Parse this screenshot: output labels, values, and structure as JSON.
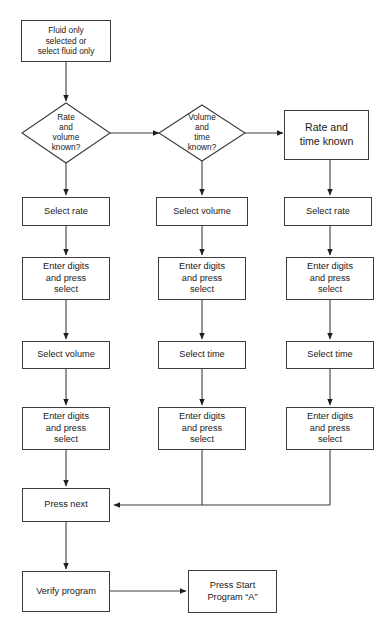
{
  "diagram": {
    "background_color": "#ffffff",
    "line_color": "#3c3c3c",
    "text_color": "#1a1a1a"
  },
  "nodes": {
    "start": {
      "label": "Fluid only\nselected or\nselect fluid only"
    },
    "decision_rate_volume": {
      "label": "Rate\nand\nvolume\nknown?"
    },
    "decision_volume_time": {
      "label": "Volume\nand\ntime\nknown?"
    },
    "rate_time_known": {
      "label": "Rate and\ntime known"
    },
    "col1": {
      "select_rate": {
        "label": "Select rate"
      },
      "enter_digits_1": {
        "label": "Enter digits\nand press\nselect"
      },
      "select_volume": {
        "label": "Select volume"
      },
      "enter_digits_2": {
        "label": "Enter digits\nand press\nselect"
      }
    },
    "col2": {
      "select_volume": {
        "label": "Select volume"
      },
      "enter_digits_1": {
        "label": "Enter digits\nand press\nselect"
      },
      "select_time": {
        "label": "Select time"
      },
      "enter_digits_2": {
        "label": "Enter digits\nand press\nselect"
      }
    },
    "col3": {
      "select_rate": {
        "label": "Select rate"
      },
      "enter_digits_1": {
        "label": "Enter digits\nand press\nselect"
      },
      "select_time": {
        "label": "Select time"
      },
      "enter_digits_2": {
        "label": "Enter digits\nand press\nselect"
      }
    },
    "press_next": {
      "label": "Press next"
    },
    "verify_program": {
      "label": "Verify program"
    },
    "press_start": {
      "label": "Press Start\nProgram “A”"
    }
  }
}
